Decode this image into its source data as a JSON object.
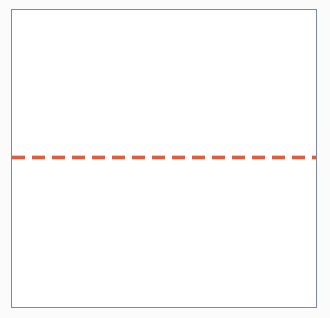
{
  "figure": {
    "title": "",
    "background_color": "#fbfbfb",
    "plot_background_color": "#ffffff",
    "frame": {
      "name": "plot-frame",
      "border_color": "#7b86ab",
      "border_width_px": 1.4,
      "left_px": 11,
      "top_px": 9,
      "width_px": 306,
      "height_px": 299
    }
  },
  "chart_data": {
    "type": "line",
    "title": "",
    "subtitle": "",
    "xlabel": "",
    "ylabel": "",
    "xlim": [
      0,
      1
    ],
    "ylim": [
      0,
      1
    ],
    "grid": false,
    "legend": null,
    "xticks": [],
    "xticklabels": [],
    "yticks": [],
    "yticklabels": [],
    "annotations": [],
    "series": [
      {
        "name": "threshold",
        "type": "hline",
        "style": "dashed",
        "color": "#d9512e",
        "linewidth_px": 3,
        "dash_px": 13,
        "gap_px": 7,
        "y_value": 0.5,
        "y_pixel": 158,
        "x_start": 0,
        "x_end": 1,
        "values": [
          0.5,
          0.5
        ]
      }
    ]
  }
}
